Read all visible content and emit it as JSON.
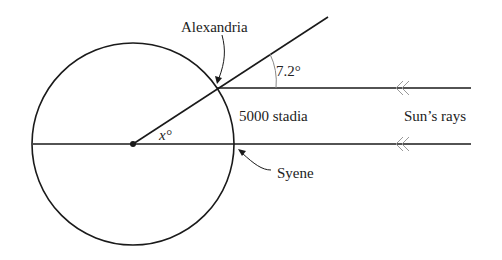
{
  "diagram": {
    "labels": {
      "alexandria": "Alexandria",
      "syene": "Syene",
      "angle_top": "7.2°",
      "angle_center": "x°",
      "distance": "5000 stadia",
      "sun_rays": "Sun’s rays"
    },
    "colors": {
      "line": "#1a1a1a",
      "arc": "#888888",
      "arrow_marks": "#999999",
      "text": "#222222",
      "background": "#ffffff"
    }
  }
}
